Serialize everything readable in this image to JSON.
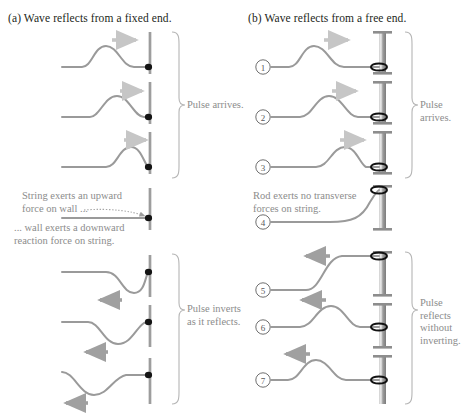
{
  "figure": {
    "panels": [
      {
        "id": "a",
        "label": "(a)",
        "title": "Wave reflects from a fixed end.",
        "boundary_type": "wall",
        "bracket_labels": [
          {
            "id": "arrives",
            "text": "Pulse arrives."
          },
          {
            "id": "inverts",
            "text": "Pulse inverts\nas it reflects."
          }
        ],
        "captions": [
          {
            "id": "string-force",
            "text": "String exerts an upward\nforce on wall ..."
          },
          {
            "id": "wall-force",
            "text": "... wall exerts a downward\nreaction force on string."
          }
        ],
        "frames": [
          {
            "index": 1,
            "direction": "right",
            "polarity": "up",
            "pulse_center_x": 104
          },
          {
            "index": 2,
            "direction": "right",
            "polarity": "up",
            "pulse_center_x": 118
          },
          {
            "index": 3,
            "direction": "right",
            "polarity": "up",
            "pulse_center_x": 132
          },
          {
            "index": 4,
            "direction": "none",
            "polarity": "flat",
            "pulse_center_x": 150
          },
          {
            "index": 5,
            "direction": "left",
            "polarity": "down",
            "pulse_center_x": 134
          },
          {
            "index": 6,
            "direction": "left",
            "polarity": "down",
            "pulse_center_x": 120
          },
          {
            "index": 7,
            "direction": "left",
            "polarity": "down",
            "pulse_center_x": 104
          }
        ]
      },
      {
        "id": "b",
        "label": "(b)",
        "title": "Wave reflects from a free end.",
        "boundary_type": "rod-with-ring",
        "bracket_labels": [
          {
            "id": "arrives",
            "text": "Pulse arrives."
          },
          {
            "id": "no-invert",
            "text": "Pulse reflects\nwithout\ninverting."
          }
        ],
        "captions": [
          {
            "id": "rod-force",
            "text": "Rod exerts no transverse\nforces on string."
          }
        ],
        "frames": [
          {
            "index": 1,
            "number": "1",
            "direction": "right",
            "polarity": "up",
            "pulse_center_x": 320
          },
          {
            "index": 2,
            "number": "2",
            "direction": "right",
            "polarity": "up",
            "pulse_center_x": 334
          },
          {
            "index": 3,
            "number": "3",
            "direction": "right",
            "polarity": "up",
            "pulse_center_x": 348
          },
          {
            "index": 4,
            "number": "4",
            "direction": "none",
            "polarity": "rise",
            "pulse_center_x": 366
          },
          {
            "index": 5,
            "number": "5",
            "direction": "left",
            "polarity": "up",
            "pulse_center_x": 348
          },
          {
            "index": 6,
            "number": "6",
            "direction": "left",
            "polarity": "up",
            "pulse_center_x": 332
          },
          {
            "index": 7,
            "number": "7",
            "direction": "left",
            "polarity": "up",
            "pulse_center_x": 316
          }
        ]
      }
    ],
    "colors": {
      "string": "#9a9a9a",
      "wall": "#8e8e8e",
      "rod": "#9b9b9b",
      "rod_dark": "#6f6f6f",
      "knot": "#1a1a1a",
      "arrow": "#c9c9c9",
      "arrow_dark": "#a6a6a6",
      "text": "#8c8c8c",
      "title": "#231f20",
      "bracket": "#b5b5b5"
    }
  }
}
